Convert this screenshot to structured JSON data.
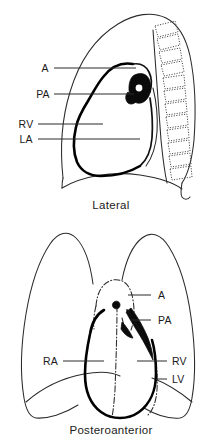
{
  "document": {
    "title": "Cardiac silhouette on chest radiograph",
    "background_color": "#ffffff",
    "ink_color": "#1a1a1a"
  },
  "figures": [
    {
      "id": "lateral",
      "caption": "Lateral",
      "view": "lateral chest radiograph",
      "labels": [
        {
          "key": "A",
          "text": "A",
          "meaning": "Aorta",
          "side": "left",
          "x": 45,
          "y": 68,
          "leader_x1": 54,
          "leader_x2": 136,
          "leader_y": 68
        },
        {
          "key": "PA",
          "text": "PA",
          "meaning": "Pulmonary artery",
          "side": "left",
          "x": 37,
          "y": 94,
          "leader_x1": 54,
          "leader_x2": 134,
          "leader_y": 94
        },
        {
          "key": "RV",
          "text": "RV",
          "meaning": "Right ventricle",
          "side": "left",
          "x": 20,
          "y": 124,
          "leader_x1": 38,
          "leader_x2": 103,
          "leader_y": 124
        },
        {
          "key": "LA",
          "text": "LA",
          "meaning": "Left atrium",
          "side": "left",
          "x": 20,
          "y": 139,
          "leader_x1": 38,
          "leader_x2": 140,
          "leader_y": 139
        }
      ],
      "structures": [
        "chest wall outline",
        "thoracic vertebral bodies",
        "diaphragm",
        "posterior costophrenic angle",
        "cardiac silhouette",
        "hilar shadow"
      ]
    },
    {
      "id": "posteroanterior",
      "caption": "Posteroanterior",
      "view": "posteroanterior chest radiograph",
      "labels": [
        {
          "key": "A",
          "text": "A",
          "meaning": "Aorta",
          "side": "right",
          "x": 155,
          "y": 295,
          "leader_x1": 128,
          "leader_x2": 151,
          "leader_y": 295
        },
        {
          "key": "PA",
          "text": "PA",
          "meaning": "Pulmonary artery",
          "side": "right",
          "x": 155,
          "y": 320,
          "leader_x1": 131,
          "leader_x2": 151,
          "leader_y": 320
        },
        {
          "key": "RA",
          "text": "RA",
          "meaning": "Right atrium",
          "side": "left",
          "x": 43,
          "y": 362,
          "leader_x1": 63,
          "leader_x2": 104,
          "leader_y": 361
        },
        {
          "key": "RV",
          "text": "RV",
          "meaning": "Right ventricle",
          "side": "right",
          "x": 170,
          "y": 362,
          "leader_x1": 137,
          "leader_x2": 167,
          "leader_y": 361
        },
        {
          "key": "LV",
          "text": "LV",
          "meaning": "Left ventricle",
          "side": "right",
          "x": 170,
          "y": 380,
          "leader_x1": 156,
          "leader_x2": 167,
          "leader_y": 379
        }
      ],
      "structures": [
        "right lung field",
        "left lung field",
        "mediastinal dash-dot border",
        "cardiac silhouette",
        "diaphragm",
        "costophrenic angles"
      ]
    }
  ]
}
